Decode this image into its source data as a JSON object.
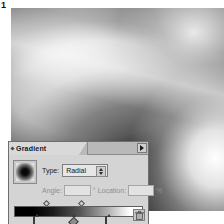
{
  "figure": {
    "number": "1"
  },
  "artwork": {
    "name": "gradient-artwork-canvas",
    "description": "Radial gradient wave artwork in greyscale",
    "colors": {
      "mid_grey": "#6d6d6d",
      "shadow": "#3a3a3a",
      "highlight": "#ffffff",
      "document_white": "#ffffff"
    }
  },
  "palette": {
    "tab": {
      "label": "Gradient",
      "grip_icon": "diamond-grip-icon"
    },
    "menu_button": {
      "icon": "triangle-right-icon",
      "tooltip": "Palette menu"
    },
    "swatch": {
      "name": "gradient-preview-swatch",
      "style": "radial-black-to-white"
    },
    "type_row": {
      "label": "Type:",
      "selected": "Radial",
      "options": [
        "Linear",
        "Radial"
      ],
      "stepper_icon": "stepper-up-down-icon"
    },
    "angle_row": {
      "angle_label": "Angle:",
      "angle_value": "",
      "degree_symbol": "°",
      "location_label": "Location:",
      "location_value": "",
      "percent_symbol": "%"
    },
    "gradient_bar": {
      "name": "gradient-slider-bar",
      "from_color": "#000000",
      "to_color": "#ffffff",
      "midpoints": [
        {
          "position_pct": 25
        },
        {
          "position_pct": 52
        }
      ],
      "stops": [
        {
          "position_pct": 16,
          "color": "#000000",
          "swatch": "dark"
        },
        {
          "position_pct": 45,
          "color": "#808080",
          "swatch": "mid"
        },
        {
          "position_pct": 72,
          "color": "#ffffff",
          "swatch": "light"
        }
      ]
    },
    "trash_button": {
      "icon": "trash-icon",
      "tooltip": "Delete stop"
    },
    "colors": {
      "panel_bg": "#d4d4d4",
      "tab_bg": "#d9d9d9",
      "tabstrip_bg": "#b9b9b9",
      "border": "#6e6e6e",
      "field_bg": "#e2e2e2",
      "dim_text": "#8e8e8e",
      "text": "#1d1d1d"
    }
  }
}
